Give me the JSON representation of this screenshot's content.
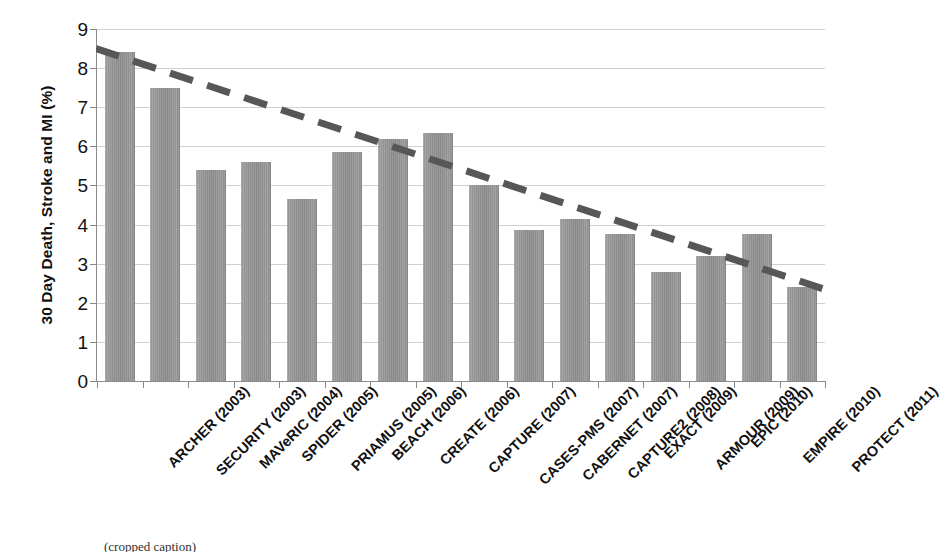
{
  "chart_data": {
    "type": "bar",
    "title": "",
    "xlabel": "",
    "ylabel": "30 Day Death, Stroke and MI (%)",
    "ylim": [
      0,
      9
    ],
    "yticks": [
      "0",
      "1",
      "2",
      "3",
      "4",
      "5",
      "6",
      "7",
      "8",
      "9"
    ],
    "grid": true,
    "legend": "none",
    "categories": [
      "ARCHER (2003)",
      "SECURITY (2003)",
      "MAVeRIC (2004)",
      "SPIDER (2005)",
      "PRIAMUS (2005)",
      "BEACH (2006)",
      "CREATE (2006)",
      "CAPTURE (2007)",
      "CASES-PMS (2007)",
      "CABERNET (2007)",
      "CAPTURE2 (2008)",
      "EXACT (2009)",
      "ARMOUR (2009)",
      "EPIC (2010)",
      "EMPIRE (2010)",
      "PROTECT (2011)"
    ],
    "values": [
      8.4,
      7.5,
      5.4,
      5.6,
      4.65,
      5.85,
      6.2,
      6.35,
      5.0,
      3.85,
      4.15,
      3.75,
      2.8,
      3.2,
      3.75,
      2.4
    ],
    "bar_color": "#979797",
    "annotations": [
      {
        "type": "trendline",
        "style": "dashed",
        "color": "#575757",
        "y_start": 8.5,
        "y_end": 2.35
      }
    ]
  },
  "bottom_caption": {
    "text": "(cropped caption)"
  }
}
